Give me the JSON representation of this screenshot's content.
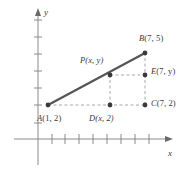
{
  "figure": {
    "type": "coordinate-geometry-diagram",
    "axes": {
      "x_label": "x",
      "y_label": "y",
      "x_tick_count": 8,
      "y_tick_count": 7,
      "grid": false,
      "arrows": [
        "x-positive",
        "y-positive"
      ]
    },
    "colors": {
      "segment": "#555555",
      "dashed": "#a8a8a8",
      "axis": "#8a8a8a",
      "text": "#3a3a3a",
      "point": "#3a3a3a",
      "background": "#ffffff"
    },
    "points": [
      {
        "id": "A",
        "name": "point-a",
        "label": "A(1, 2)",
        "label_letter": "A",
        "label_coords": "(1, 2)",
        "data_x": 1,
        "data_y": 2,
        "px": 48,
        "py": 105,
        "marker": true,
        "label_px": 36,
        "label_py": 110
      },
      {
        "id": "B",
        "name": "point-b",
        "label": "B(7, 5)",
        "label_letter": "B",
        "label_coords": "(7, 5)",
        "data_x": 7,
        "data_y": 5,
        "px": 145,
        "py": 53,
        "marker": true,
        "label_px": 139,
        "label_py": 36
      },
      {
        "id": "P",
        "name": "point-p",
        "label": "P(x, y)",
        "label_letter": "P",
        "label_coords": "(x, y)",
        "data_x": "x",
        "data_y": "y",
        "px": 110,
        "py": 75,
        "marker": true,
        "label_px": 79,
        "label_py": 57
      },
      {
        "id": "D",
        "name": "point-d",
        "label": "D(x, 2)",
        "label_letter": "D",
        "label_coords": "(x, 2)",
        "data_x": "x",
        "data_y": 2,
        "px": 110,
        "py": 105,
        "marker": true,
        "label_px": 88,
        "label_py": 110
      },
      {
        "id": "C",
        "name": "point-c",
        "label": "C(7, 2)",
        "label_letter": "C",
        "label_coords": "(7, 2)",
        "data_x": 7,
        "data_y": 2,
        "px": 145,
        "py": 105,
        "marker": true,
        "label_px": 150,
        "label_py": 100
      },
      {
        "id": "E",
        "name": "point-e",
        "label": "E(7, y)",
        "label_letter": "E",
        "label_coords": "(7, y)",
        "data_x": 7,
        "data_y": "y",
        "px": 145,
        "py": 75,
        "marker": true,
        "label_px": 150,
        "label_py": 70
      }
    ],
    "segments": [
      {
        "name": "segment-ab",
        "from": "A",
        "to": "B",
        "style": "solid"
      }
    ],
    "dashed_segments": [
      {
        "name": "dashed-a-to-c",
        "from": "A",
        "to": "C"
      },
      {
        "name": "dashed-d-to-p",
        "from": "D",
        "to": "P"
      },
      {
        "name": "dashed-p-to-e",
        "from": "P",
        "to": "E"
      },
      {
        "name": "dashed-c-to-b",
        "from": "C",
        "to": "B"
      }
    ]
  }
}
